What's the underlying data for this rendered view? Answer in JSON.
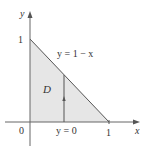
{
  "diagram": {
    "region_label": "D",
    "curve_label": "y = 1 − x",
    "bottom_label": "y = 0",
    "axis_x_label": "x",
    "axis_y_label": "y",
    "tick_origin": "0",
    "tick_x1": "1",
    "tick_y1": "1",
    "colors": {
      "fill": "#e6e6e6",
      "line": "#555555",
      "axis": "#666666"
    }
  }
}
